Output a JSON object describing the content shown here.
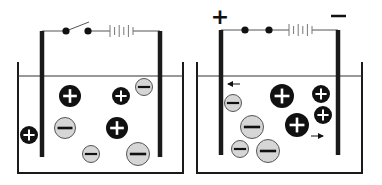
{
  "figure": {
    "colors": {
      "background": "#ffffff",
      "wall": "#1a1a1a",
      "electrode": "#1a1a1a",
      "water_line": "#333333",
      "wire": "#555555",
      "cation_fill": "#111111",
      "cation_symbol": "#ffffff",
      "anion_fill": "#d6d6d6",
      "anion_stroke": "#555555",
      "anion_symbol": "#111111"
    }
  },
  "panels": [
    {
      "id": "left",
      "label": "circuit-open",
      "switch_state": "open",
      "terminal_labels": {
        "positive": "",
        "negative": ""
      },
      "beaker": {
        "x1": 18,
        "x2": 183,
        "top": 62,
        "water_y": 76,
        "bottom": 173
      },
      "electrodes": [
        {
          "x": 42,
          "y1": 31,
          "y2": 157
        },
        {
          "x": 160,
          "y1": 31,
          "y2": 157
        }
      ],
      "wire_y": 31,
      "switch": {
        "dot1_x": 66,
        "dot2_x": 88
      },
      "battery": {
        "x1": 110,
        "x2": 133
      },
      "ions": [
        {
          "type": "cation",
          "symbol": "+",
          "cx": 70,
          "cy": 96,
          "r": 11
        },
        {
          "type": "anion",
          "symbol": "−",
          "cx": 65,
          "cy": 128,
          "r": 11
        },
        {
          "type": "anion",
          "symbol": "−",
          "cx": 91,
          "cy": 154,
          "r": 9
        },
        {
          "type": "cation",
          "symbol": "+",
          "cx": 121,
          "cy": 96,
          "r": 9
        },
        {
          "type": "anion",
          "symbol": "−",
          "cx": 144,
          "cy": 87,
          "r": 9
        },
        {
          "type": "cation",
          "symbol": "+",
          "cx": 117,
          "cy": 128,
          "r": 11
        },
        {
          "type": "anion",
          "symbol": "−",
          "cx": 138,
          "cy": 154,
          "r": 12
        },
        {
          "type": "cation",
          "symbol": "+",
          "cx": 29,
          "cy": 135,
          "r": 9
        }
      ],
      "arrows": []
    },
    {
      "id": "right",
      "label": "circuit-closed",
      "switch_state": "closed",
      "terminal_labels": {
        "positive": "+",
        "negative": "−"
      },
      "beaker": {
        "x1": 197,
        "x2": 362,
        "top": 62,
        "water_y": 76,
        "bottom": 173
      },
      "electrodes": [
        {
          "x": 221,
          "y1": 30,
          "y2": 155
        },
        {
          "x": 338,
          "y1": 30,
          "y2": 155
        }
      ],
      "wire_y": 30,
      "switch": {
        "dot1_x": 245,
        "dot2_x": 269
      },
      "battery": {
        "x1": 289,
        "x2": 312
      },
      "ions": [
        {
          "type": "anion",
          "symbol": "−",
          "cx": 233,
          "cy": 103,
          "r": 9
        },
        {
          "type": "anion",
          "symbol": "−",
          "cx": 252,
          "cy": 127,
          "r": 12
        },
        {
          "type": "anion",
          "symbol": "−",
          "cx": 240,
          "cy": 149,
          "r": 9
        },
        {
          "type": "anion",
          "symbol": "−",
          "cx": 268,
          "cy": 151,
          "r": 12
        },
        {
          "type": "cation",
          "symbol": "+",
          "cx": 282,
          "cy": 96,
          "r": 12
        },
        {
          "type": "cation",
          "symbol": "+",
          "cx": 321,
          "cy": 94,
          "r": 9
        },
        {
          "type": "cation",
          "symbol": "+",
          "cx": 323,
          "cy": 115,
          "r": 9
        },
        {
          "type": "cation",
          "symbol": "+",
          "cx": 297,
          "cy": 125,
          "r": 12
        }
      ],
      "arrows": [
        {
          "direction": "left",
          "x1": 240,
          "x2": 228,
          "y": 84
        },
        {
          "direction": "right",
          "x1": 311,
          "x2": 323,
          "y": 136
        }
      ]
    }
  ]
}
